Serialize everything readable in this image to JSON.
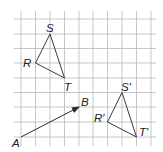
{
  "diagram": {
    "type": "translation-on-grid",
    "grid": {
      "x_lines": [
        21,
        35.5,
        50,
        64.5,
        79,
        93,
        107.5,
        122,
        136.5,
        151
      ],
      "y_lines": [
        19,
        34,
        48.5,
        63,
        78,
        92.5,
        107,
        122,
        137
      ],
      "x_extent": [
        14,
        156
      ],
      "y_extent": [
        11,
        146
      ],
      "color": "#b8b8b8"
    },
    "vector": {
      "from_label": "A",
      "to_label": "B",
      "from": [
        21,
        137
      ],
      "to": [
        79,
        107
      ]
    },
    "original_triangle": {
      "labels": {
        "R": "R",
        "S": "S",
        "T": "T"
      },
      "R": [
        35.5,
        63
      ],
      "S": [
        50,
        34
      ],
      "T": [
        64.5,
        78
      ]
    },
    "image_triangle": {
      "labels": {
        "R": "R′",
        "S": "S′",
        "T": "T′"
      },
      "R": [
        107.5,
        122
      ],
      "S": [
        122,
        92.5
      ],
      "T": [
        136.5,
        137
      ]
    },
    "label_positions": {
      "A": [
        12,
        147
      ],
      "B": [
        81,
        106
      ],
      "R": [
        23,
        67
      ],
      "S": [
        46,
        32
      ],
      "T": [
        64,
        91
      ],
      "R_prime": [
        94,
        122
      ],
      "S_prime": [
        121,
        91
      ],
      "T_prime": [
        139,
        136
      ]
    },
    "stroke_color": "#3a3a3a"
  }
}
